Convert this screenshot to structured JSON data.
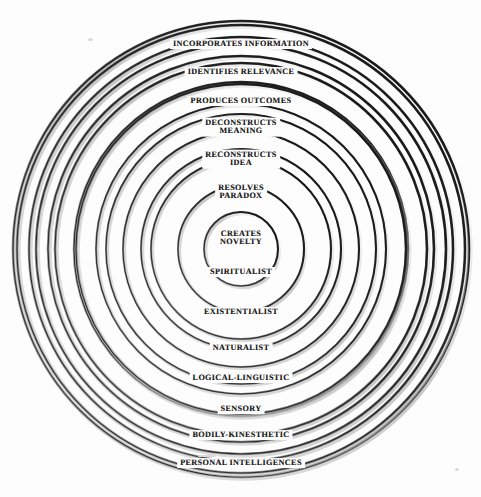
{
  "diagram": {
    "type": "concentric-circles",
    "center": {
      "x": 241,
      "y": 249
    },
    "background_color": "#fdfdfd",
    "stroke_color": "#1a1a1a",
    "shadow_color": "#9a9a9a",
    "rings": [
      {
        "index": 1,
        "label": "INCORPORATES INFORMATION",
        "radius": 224,
        "label_side": "top",
        "label_x": 241,
        "label_y": 44,
        "font_size": 8.2,
        "lines": 1
      },
      {
        "index": 2,
        "label": "IDENTIFIES RELEVANCE",
        "radius": 205,
        "label_side": "top",
        "label_x": 241,
        "label_y": 72,
        "font_size": 8.2,
        "lines": 1
      },
      {
        "index": 3,
        "label": "PRODUCES OUTCOMES",
        "radius": 186,
        "label_side": "top",
        "label_x": 241,
        "label_y": 101,
        "font_size": 8.2,
        "lines": 1
      },
      {
        "index": 4,
        "label": "DECONSTRUCTS\nMEANING",
        "radius": 167,
        "label_side": "top",
        "label_x": 241,
        "label_y": 127,
        "font_size": 8.2,
        "lines": 2
      },
      {
        "index": 5,
        "label": "RECONSTRUCTS\nIDEA",
        "radius": 145,
        "label_side": "top",
        "label_x": 241,
        "label_y": 159,
        "font_size": 8.2,
        "lines": 2
      },
      {
        "index": 6,
        "label": "RESOLVES\nPARADOX",
        "radius": 118,
        "label_side": "top",
        "label_x": 241,
        "label_y": 192,
        "font_size": 8.2,
        "lines": 2
      },
      {
        "index": 7,
        "label": "CREATES\nNOVELTY",
        "radius": 90,
        "label_side": "center",
        "label_x": 241,
        "label_y": 238,
        "font_size": 8.2,
        "lines": 2
      },
      {
        "index": 8,
        "label": "SPIRITUALIST",
        "radius": 63,
        "label_side": "bottom",
        "label_x": 241,
        "label_y": 272,
        "font_size": 8.2,
        "lines": 1
      },
      {
        "index": 9,
        "label": "EXISTENTIALIST",
        "radius": 100,
        "label_side": "bottom",
        "label_x": 241,
        "label_y": 312,
        "font_size": 8.2,
        "lines": 1
      },
      {
        "index": 10,
        "label": "NATURALIST",
        "radius": 135,
        "label_side": "bottom",
        "label_x": 241,
        "label_y": 348,
        "font_size": 8.2,
        "lines": 1
      },
      {
        "index": 11,
        "label": "LOGICAL-LINGUISTIC",
        "radius": 165,
        "label_side": "bottom",
        "label_x": 241,
        "label_y": 378,
        "font_size": 8.2,
        "lines": 1
      },
      {
        "index": 12,
        "label": "SENSORY",
        "radius": 193,
        "label_side": "bottom",
        "label_x": 241,
        "label_y": 409,
        "font_size": 8.2,
        "lines": 1
      },
      {
        "index": 13,
        "label": "BODILY-KINESTHETIC",
        "radius": 212,
        "label_side": "bottom",
        "label_x": 241,
        "label_y": 435,
        "font_size": 8.2,
        "lines": 1
      },
      {
        "index": 14,
        "label": "PERSONAL INTELLIGENCES",
        "radius": 228,
        "label_side": "bottom",
        "label_x": 241,
        "label_y": 463,
        "font_size": 8.2,
        "lines": 1
      }
    ],
    "circle_radii": [
      228,
      224,
      212,
      205,
      193,
      186,
      165,
      167,
      145,
      135,
      118,
      100,
      90,
      63,
      37
    ]
  }
}
